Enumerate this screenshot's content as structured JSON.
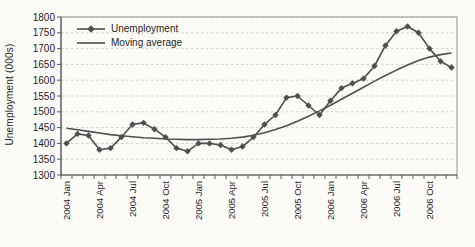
{
  "page": {
    "background": "#fcfbf7"
  },
  "colors": {
    "series": "#4f4f4f",
    "gridline": "#c9c9c9",
    "frame": "#8f8f8f",
    "axis": "#5a5a5a",
    "text": "#1f1f1f"
  },
  "chart_data": {
    "type": "line",
    "title": "",
    "xlabel": "",
    "ylabel": "Unemployment (000s)",
    "ylim": [
      1300,
      1800
    ],
    "y_ticks": [
      1300,
      1350,
      1400,
      1450,
      1500,
      1550,
      1600,
      1650,
      1700,
      1750,
      1800
    ],
    "grid": "horizontal-dashed",
    "legend_position": "top-left-inside",
    "x": [
      "2004 Jan",
      "2004 Feb",
      "2004 Mar",
      "2004 Apr",
      "2004 May",
      "2004 Jun",
      "2004 Jul",
      "2004 Aug",
      "2004 Sep",
      "2004 Oct",
      "2004 Nov",
      "2004 Dec",
      "2005 Jan",
      "2005 Feb",
      "2005 Mar",
      "2005 Apr",
      "2005 May",
      "2005 Jun",
      "2005 Jul",
      "2005 Aug",
      "2005 Sep",
      "2005 Oct",
      "2005 Nov",
      "2005 Dec",
      "2006 Jan",
      "2006 Feb",
      "2006 Mar",
      "2006 Apr",
      "2006 May",
      "2006 Jun",
      "2006 Jul",
      "2006 Aug",
      "2006 Sep",
      "2006 Oct",
      "2006 Nov",
      "2006 Dec"
    ],
    "x_tick_label_every": 3,
    "x_tick_labels": [
      "2004 Jan",
      "2004 Apr",
      "2004 Jul",
      "2004 Oct",
      "2005 Jan",
      "2005 Apr",
      "2005 Jul",
      "2005 Oct",
      "2006 Jan",
      "2006 Apr",
      "2006 Jul",
      "2006 Oct"
    ],
    "series": [
      {
        "name": "Unemployment",
        "marker": "diamond",
        "color": "#4f4f4f",
        "values": [
          1400,
          1430,
          1425,
          1380,
          1385,
          1420,
          1460,
          1465,
          1445,
          1420,
          1385,
          1375,
          1400,
          1400,
          1395,
          1380,
          1390,
          1420,
          1460,
          1490,
          1545,
          1550,
          1520,
          1490,
          1535,
          1575,
          1590,
          1605,
          1645,
          1710,
          1755,
          1770,
          1750,
          1700,
          1660,
          1640
        ]
      },
      {
        "name": "Moving average",
        "marker": "none",
        "color": "#4f4f4f",
        "values": [
          1448,
          1443,
          1438,
          1433,
          1428,
          1424,
          1421,
          1418,
          1416,
          1414,
          1413,
          1412,
          1412,
          1413,
          1414,
          1416,
          1420,
          1426,
          1434,
          1444,
          1456,
          1470,
          1486,
          1503,
          1521,
          1540,
          1559,
          1578,
          1597,
          1615,
          1632,
          1648,
          1662,
          1673,
          1681,
          1686
        ]
      }
    ]
  }
}
